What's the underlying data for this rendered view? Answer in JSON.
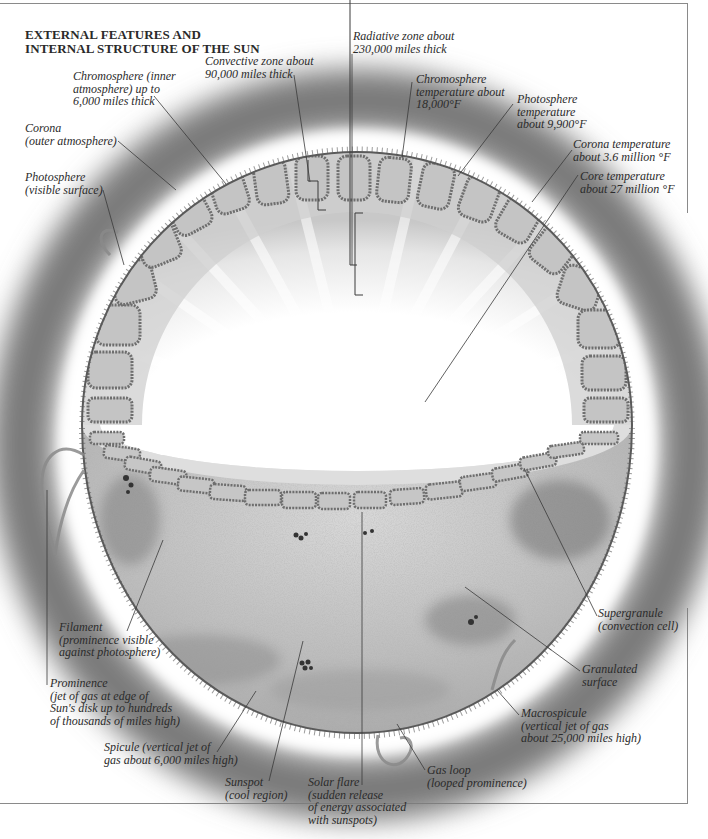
{
  "title": {
    "line1": "EXTERNAL FEATURES AND",
    "line2": "INTERNAL STRUCTURE OF THE SUN"
  },
  "labels": {
    "radiative_zone": [
      "Radiative zone about",
      "230,000 miles thick"
    ],
    "convective_zone": [
      "Convective zone about",
      "90,000 miles thick"
    ],
    "chromosphere": [
      "Chromosphere (inner",
      "atmosphere) up to",
      "6,000 miles thick"
    ],
    "corona": [
      "Corona",
      "(outer atmosphere)"
    ],
    "photosphere": [
      "Photosphere",
      "(visible surface)"
    ],
    "chromosphere_temp": [
      "Chromosphere",
      "temperature about",
      "18,000°F"
    ],
    "photosphere_temp": [
      "Photosphere",
      "temperature",
      "about 9,900°F"
    ],
    "corona_temp": [
      "Corona temperature",
      "about 3.6 million °F"
    ],
    "core_temp": [
      "Core temperature",
      "about 27 million °F"
    ],
    "filament": [
      "Filament",
      "(prominence visible",
      "against photosphere)"
    ],
    "prominence": [
      "Prominence",
      "(jet of gas at edge of",
      "Sun's disk up to hundreds",
      "of thousands of miles high)"
    ],
    "spicule": [
      "Spicule (vertical jet of",
      "gas about 6,000 miles high)"
    ],
    "sunspot": [
      "Sunspot",
      "(cool region)"
    ],
    "solar_flare": [
      "Solar flare",
      "(sudden release",
      "of energy associated",
      "with sunspots)"
    ],
    "gas_loop": [
      "Gas loop",
      "(looped prominence)"
    ],
    "macrospicule": [
      "Macrospicule",
      "(vertical jet of gas",
      "about 25,000 miles high)"
    ],
    "granulated_surface": [
      "Granulated",
      "surface"
    ],
    "supergranule": [
      "Supergranule",
      "(convection cell)"
    ]
  },
  "colors": {
    "corona_halo": "#7a7a7a",
    "photosphere_surface": "#b9b9b9",
    "cell_outline": "#6e6e6e",
    "leader_line": "#3a3a3a",
    "text": "#2b2b2b",
    "frame": "#8a8a8a"
  }
}
